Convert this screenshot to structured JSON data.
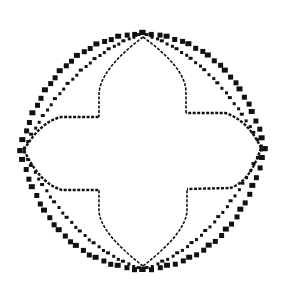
{
  "diagram": {
    "type": "line-drawing",
    "background": "#ffffff",
    "ink_color": "#111111",
    "apexes": {
      "top": [
        143,
        33
      ],
      "bottom": [
        143,
        270
      ],
      "left": [
        20,
        150
      ],
      "right": [
        265,
        148
      ]
    },
    "outer_curve": {
      "style": "heavy-dotted",
      "marker_size": 5
    },
    "middle_curve": {
      "style": "light-dashed",
      "marker_size": 3
    },
    "inner_cross": {
      "style": "thin-dashed",
      "corners": {
        "upper_left": [
          99,
          117
        ],
        "upper_right": [
          186,
          113
        ],
        "lower_left": [
          99,
          190
        ],
        "lower_right": [
          187,
          189
        ]
      },
      "arm_ends": {
        "left_upper": [
          61,
          117
        ],
        "right_upper": [
          225,
          113
        ],
        "left_lower": [
          62,
          190
        ],
        "right_lower": [
          230,
          188
        ]
      }
    }
  }
}
